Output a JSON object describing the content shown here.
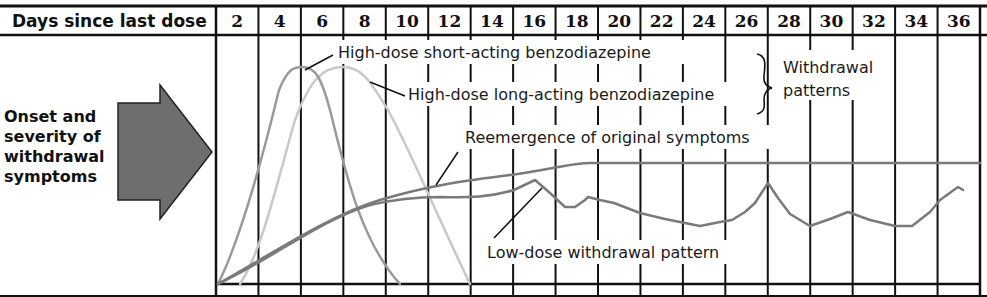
{
  "header": {
    "title": "Days since last dose",
    "days": [
      "2",
      "4",
      "6",
      "8",
      "10",
      "12",
      "14",
      "16",
      "18",
      "20",
      "22",
      "24",
      "26",
      "28",
      "30",
      "32",
      "34",
      "36"
    ]
  },
  "side_label": {
    "lines": [
      "Onset and",
      "severity of",
      "withdrawal",
      "symptoms"
    ]
  },
  "annotations": {
    "short_acting": "High-dose short-acting benzodiazepine",
    "long_acting": "High-dose long-acting benzodiazepine",
    "brace_label_line1": "Withdrawal",
    "brace_label_line2": "patterns",
    "reemergence": "Reemergence of original symptoms",
    "low_dose": "Low-dose withdrawal pattern"
  },
  "colors": {
    "grid": "#111111",
    "arrow_fill": "#6e6e6e",
    "short_acting": "#9a9a9a",
    "long_acting": "#c8c8c8",
    "reemergence": "#7a7a7a",
    "low_dose": "#7a7a7a"
  },
  "chart_data": {
    "type": "line",
    "title": "",
    "xlabel": "Days since last dose",
    "ylabel": "Onset and severity of withdrawal symptoms",
    "x_ticks": [
      2,
      4,
      6,
      8,
      10,
      12,
      14,
      16,
      18,
      20,
      22,
      24,
      26,
      28,
      30,
      32,
      34,
      36
    ],
    "xlim": [
      1,
      37
    ],
    "ylim": [
      0,
      100
    ],
    "grid": true,
    "legend": "inline annotations",
    "series": [
      {
        "name": "High-dose short-acting benzodiazepine",
        "x": [
          1,
          2,
          3,
          4,
          5,
          6,
          7,
          8,
          9
        ],
        "y": [
          0,
          25,
          70,
          95,
          100,
          80,
          40,
          12,
          0
        ]
      },
      {
        "name": "High-dose long-acting benzodiazepine",
        "x": [
          2,
          3,
          4,
          5,
          6,
          7,
          8,
          9,
          10,
          11,
          12
        ],
        "y": [
          0,
          15,
          55,
          88,
          100,
          90,
          65,
          40,
          20,
          6,
          0
        ]
      },
      {
        "name": "Reemergence of original symptoms",
        "x": [
          1,
          4,
          8,
          12,
          16,
          18,
          20,
          24,
          28,
          32,
          36
        ],
        "y": [
          0,
          20,
          38,
          50,
          55,
          57,
          57,
          57,
          57,
          57,
          57
        ]
      },
      {
        "name": "Low-dose withdrawal pattern",
        "x": [
          1,
          4,
          8,
          12,
          14,
          16,
          18,
          19,
          20,
          22,
          24,
          26,
          27,
          28,
          29,
          30,
          32,
          34,
          35,
          36
        ],
        "y": [
          0,
          18,
          36,
          43,
          43,
          46,
          38,
          40,
          36,
          30,
          27,
          33,
          48,
          37,
          28,
          35,
          27,
          27,
          36,
          44
        ]
      }
    ],
    "annotations": [
      "High-dose short-acting benzodiazepine",
      "High-dose long-acting benzodiazepine",
      "Withdrawal patterns",
      "Reemergence of original symptoms",
      "Low-dose withdrawal pattern"
    ]
  }
}
